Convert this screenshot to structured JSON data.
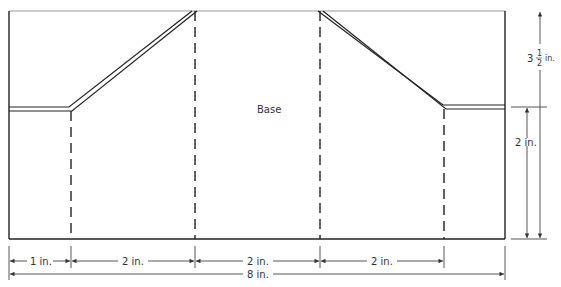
{
  "diagram": {
    "center_label": "Base",
    "bottom_dimensions": [
      {
        "label": "1 in.",
        "x1": 9,
        "x2": 71
      },
      {
        "label": "2 in.",
        "x1": 71,
        "x2": 195
      },
      {
        "label": "2 in.",
        "x1": 195,
        "x2": 320
      },
      {
        "label": "2 in.",
        "x1": 320,
        "x2": 444
      }
    ],
    "total_width": {
      "label": "8 in."
    },
    "right_dimensions": {
      "inner": {
        "label": "2 in."
      },
      "outer": {
        "whole": "3",
        "numerator": "1",
        "denominator": "2",
        "unit": "in."
      }
    },
    "colors": {
      "line": "#222222",
      "dim": "#444444"
    }
  }
}
